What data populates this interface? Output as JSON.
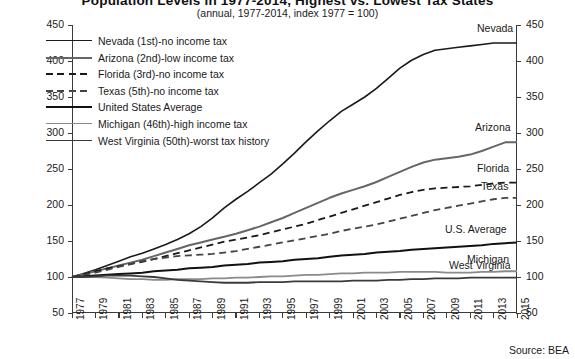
{
  "title": {
    "main": "Population Levels in 1977-2014, Highest vs. Lowest Tax States",
    "sub": "(annual, 1977-2014, index 1977 = 100)"
  },
  "source_note": "Source: BEA",
  "legend": {
    "items": [
      {
        "label": "Nevada (1st)-no income tax",
        "style": "solid",
        "color": "#1a1a1a",
        "width": 1.6
      },
      {
        "label": "Arizona (2nd)-low income tax",
        "style": "solid",
        "color": "#666666",
        "width": 2.0
      },
      {
        "label": "Florida (3rd)-no income tax",
        "style": "dashed",
        "color": "#1a1a1a",
        "width": 1.8
      },
      {
        "label": "Texas (5th)-no income tax",
        "style": "dashed",
        "color": "#444444",
        "width": 1.8
      },
      {
        "label": "United States Average",
        "style": "solid",
        "color": "#111111",
        "width": 2.0
      },
      {
        "label": "Michigan (46th)-high income tax",
        "style": "solid",
        "color": "#8a8a8a",
        "width": 1.8
      },
      {
        "label": "West Virginia (50th)-worst tax history",
        "style": "solid",
        "color": "#3a3a3a",
        "width": 1.8
      }
    ]
  },
  "end_labels": [
    {
      "name": "Nevada",
      "value": 425
    },
    {
      "name": "Arizona",
      "value": 287
    },
    {
      "name": "Florida",
      "value": 231
    },
    {
      "name": "Texas",
      "value": 210
    },
    {
      "name": "U.S. Average",
      "value": 148
    },
    {
      "name": "Michigan",
      "value": 108
    },
    {
      "name": "West Virginia",
      "value": 99
    }
  ],
  "chart_data": {
    "type": "line",
    "title": "Population Levels in 1977-2014, Highest vs. Lowest Tax States",
    "subtitle": "(annual, 1977-2014, index 1977 = 100)",
    "xlabel": "",
    "ylabel": "",
    "xlim": [
      1977,
      2015
    ],
    "ylim": [
      50,
      450
    ],
    "ytick_step": 50,
    "yticks": [
      50,
      100,
      150,
      200,
      250,
      300,
      350,
      400,
      450
    ],
    "dual_y_axis": true,
    "grid": false,
    "legend_position": "top-left",
    "x": [
      1977,
      1978,
      1979,
      1980,
      1981,
      1982,
      1983,
      1984,
      1985,
      1986,
      1987,
      1988,
      1989,
      1990,
      1991,
      1992,
      1993,
      1994,
      1995,
      1996,
      1997,
      1998,
      1999,
      2000,
      2001,
      2002,
      2003,
      2004,
      2005,
      2006,
      2007,
      2008,
      2009,
      2010,
      2011,
      2012,
      2013,
      2014,
      2015
    ],
    "xticks": [
      1977,
      1979,
      1981,
      1983,
      1985,
      1987,
      1989,
      1991,
      1993,
      1995,
      1997,
      1999,
      2001,
      2003,
      2005,
      2007,
      2009,
      2011,
      2013,
      2015
    ],
    "series": [
      {
        "name": "Nevada",
        "legend": "Nevada (1st)-no income tax",
        "style": "solid",
        "color": "#1a1a1a",
        "width": 1.6,
        "values": [
          100,
          105,
          110,
          116,
          122,
          128,
          133,
          139,
          145,
          152,
          160,
          170,
          182,
          196,
          208,
          219,
          231,
          243,
          257,
          272,
          288,
          303,
          317,
          330,
          340,
          350,
          362,
          376,
          390,
          401,
          409,
          415,
          417,
          419,
          421,
          423,
          425,
          425,
          425
        ]
      },
      {
        "name": "Arizona",
        "legend": "Arizona (2nd)-low income tax",
        "style": "solid",
        "color": "#666666",
        "width": 2.0,
        "values": [
          100,
          104,
          108,
          112,
          116,
          120,
          124,
          129,
          134,
          139,
          144,
          148,
          152,
          156,
          160,
          165,
          170,
          176,
          182,
          189,
          196,
          203,
          210,
          216,
          221,
          226,
          232,
          239,
          246,
          253,
          259,
          263,
          265,
          267,
          270,
          275,
          281,
          287,
          287
        ]
      },
      {
        "name": "Florida",
        "legend": "Florida (3rd)-no income tax",
        "style": "dashed",
        "color": "#1a1a1a",
        "width": 1.8,
        "values": [
          100,
          104,
          108,
          112,
          115,
          118,
          121,
          125,
          129,
          133,
          137,
          141,
          145,
          149,
          152,
          155,
          158,
          162,
          166,
          170,
          174,
          179,
          184,
          189,
          194,
          199,
          204,
          209,
          214,
          218,
          221,
          223,
          224,
          225,
          226,
          228,
          230,
          231,
          231
        ]
      },
      {
        "name": "Texas",
        "legend": "Texas (5th)-no income tax",
        "style": "dashed",
        "color": "#444444",
        "width": 1.8,
        "values": [
          100,
          103,
          106,
          110,
          114,
          118,
          122,
          125,
          127,
          129,
          130,
          131,
          132,
          134,
          136,
          139,
          142,
          145,
          148,
          151,
          154,
          157,
          160,
          164,
          167,
          170,
          173,
          177,
          181,
          185,
          189,
          193,
          196,
          199,
          202,
          205,
          208,
          210,
          210
        ]
      },
      {
        "name": "U.S. Average",
        "legend": "United States Average",
        "style": "solid",
        "color": "#111111",
        "width": 2.0,
        "values": [
          100,
          101,
          102,
          103,
          104,
          105,
          106,
          108,
          109,
          110,
          112,
          113,
          114,
          116,
          117,
          118,
          120,
          121,
          122,
          124,
          125,
          126,
          128,
          130,
          131,
          132,
          134,
          135,
          136,
          138,
          139,
          140,
          141,
          142,
          143,
          144,
          146,
          147,
          148
        ]
      },
      {
        "name": "Michigan",
        "legend": "Michigan (46th)-high income tax",
        "style": "solid",
        "color": "#8a8a8a",
        "width": 1.8,
        "values": [
          100,
          100,
          100,
          99,
          98,
          97,
          97,
          96,
          96,
          97,
          97,
          97,
          98,
          98,
          99,
          99,
          100,
          101,
          101,
          102,
          103,
          103,
          104,
          105,
          105,
          106,
          106,
          106,
          107,
          107,
          107,
          107,
          106,
          106,
          106,
          107,
          107,
          108,
          108
        ]
      },
      {
        "name": "West Virginia",
        "legend": "West Virginia (50th)-worst tax history",
        "style": "solid",
        "color": "#3a3a3a",
        "width": 1.8,
        "values": [
          100,
          100,
          101,
          102,
          102,
          102,
          101,
          100,
          98,
          96,
          95,
          94,
          93,
          92,
          92,
          92,
          93,
          93,
          93,
          94,
          94,
          94,
          94,
          94,
          95,
          95,
          95,
          96,
          96,
          97,
          97,
          98,
          98,
          98,
          99,
          99,
          99,
          99,
          99
        ]
      }
    ]
  }
}
